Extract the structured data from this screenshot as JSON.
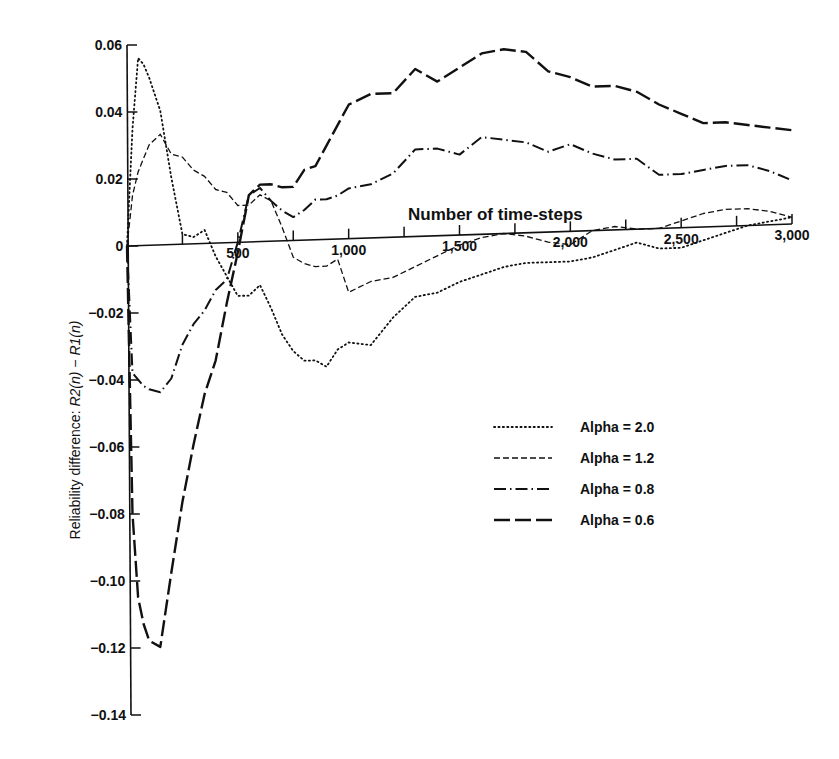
{
  "chart_data": {
    "type": "line",
    "title": "",
    "xlabel": "Number of time-steps",
    "ylabel": "Reliability difference: R2(n) − R1(n)",
    "xlim": [
      0,
      3000
    ],
    "ylim": [
      -0.14,
      0.06
    ],
    "grid": false,
    "legend_position": "right-middle",
    "x_ticks": [
      500,
      1000,
      1500,
      2000,
      2500,
      3000
    ],
    "x_tick_labels": [
      "500",
      "1,000",
      "1,500",
      "2,000",
      "2,500",
      "3,000"
    ],
    "x_minor_tick_step": 250,
    "y_ticks": [
      0.06,
      0.04,
      0.02,
      0,
      -0.02,
      -0.04,
      -0.06,
      -0.08,
      -0.1,
      -0.12,
      -0.14
    ],
    "y_tick_labels": [
      "0.06",
      "0.04",
      "0.02",
      "0",
      "−0.02",
      "−0.04",
      "−0.06",
      "−0.08",
      "−0.10",
      "−0.12",
      "−0.14"
    ],
    "x": [
      0,
      25,
      50,
      75,
      100,
      150,
      200,
      250,
      300,
      350,
      400,
      450,
      500,
      550,
      600,
      650,
      700,
      750,
      800,
      850,
      900,
      950,
      1000,
      1100,
      1200,
      1300,
      1400,
      1500,
      1600,
      1700,
      1800,
      1900,
      2000,
      2100,
      2200,
      2300,
      2400,
      2500,
      2600,
      2700,
      2800,
      2900,
      3000
    ],
    "series": [
      {
        "name": "Alpha = 2.0",
        "style": "dotted",
        "values": [
          0,
          0.035,
          0.056,
          0.054,
          0.05,
          0.04,
          0.02,
          0.003,
          0.002,
          0.004,
          -0.004,
          -0.01,
          -0.016,
          -0.016,
          -0.013,
          -0.02,
          -0.028,
          -0.033,
          -0.036,
          -0.036,
          -0.038,
          -0.033,
          -0.031,
          -0.032,
          -0.024,
          -0.018,
          -0.017,
          -0.014,
          -0.012,
          -0.01,
          -0.009,
          -0.009,
          -0.009,
          -0.008,
          -0.006,
          -0.004,
          -0.006,
          -0.006,
          -0.004,
          -0.002,
          0.0,
          0.001,
          0.002
        ]
      },
      {
        "name": "Alpha = 1.2",
        "style": "dashed-short",
        "values": [
          0,
          0.015,
          0.022,
          0.026,
          0.03,
          0.033,
          0.027,
          0.026,
          0.022,
          0.02,
          0.016,
          0.015,
          0.011,
          0.011,
          0.014,
          0.012,
          0.004,
          -0.005,
          -0.007,
          -0.008,
          -0.008,
          -0.006,
          -0.016,
          -0.013,
          -0.012,
          -0.009,
          -0.006,
          -0.003,
          -0.001,
          0.0,
          -0.001,
          -0.003,
          -0.004,
          0.0,
          0.001,
          0.0,
          0.0,
          0.002,
          0.004,
          0.005,
          0.005,
          0.004,
          0.002
        ]
      },
      {
        "name": "Alpha = 0.8",
        "style": "dash-dot",
        "values": [
          0,
          -0.038,
          -0.04,
          -0.042,
          -0.043,
          -0.044,
          -0.04,
          -0.03,
          -0.024,
          -0.02,
          -0.014,
          -0.011,
          0.0,
          0.014,
          0.016,
          0.012,
          0.009,
          0.007,
          0.009,
          0.012,
          0.012,
          0.013,
          0.015,
          0.016,
          0.019,
          0.026,
          0.026,
          0.024,
          0.029,
          0.028,
          0.027,
          0.024,
          0.026,
          0.023,
          0.021,
          0.021,
          0.016,
          0.016,
          0.017,
          0.018,
          0.018,
          0.016,
          0.013
        ]
      },
      {
        "name": "Alpha = 0.6",
        "style": "dashed-long",
        "values": [
          0,
          -0.08,
          -0.105,
          -0.113,
          -0.118,
          -0.12,
          -0.098,
          -0.077,
          -0.06,
          -0.045,
          -0.035,
          -0.018,
          -0.003,
          0.014,
          0.017,
          0.017,
          0.016,
          0.016,
          0.021,
          0.022,
          0.028,
          0.034,
          0.04,
          0.043,
          0.043,
          0.05,
          0.046,
          0.05,
          0.054,
          0.055,
          0.054,
          0.048,
          0.046,
          0.043,
          0.043,
          0.041,
          0.037,
          0.034,
          0.031,
          0.031,
          0.03,
          0.029,
          0.028
        ]
      }
    ]
  },
  "axes": {
    "xlabel": "Number of time-steps",
    "ylabel_prefix": "Reliability difference: ",
    "ylabel_expr": "R2(n) − R1(n)"
  },
  "legend": [
    {
      "label": "Alpha  =  2.0",
      "style": "dotted"
    },
    {
      "label": "Alpha  =  1.2",
      "style": "dashed-short"
    },
    {
      "label": "Alpha  =  0.8",
      "style": "dash-dot"
    },
    {
      "label": "Alpha  =  0.6",
      "style": "dashed-long"
    }
  ]
}
